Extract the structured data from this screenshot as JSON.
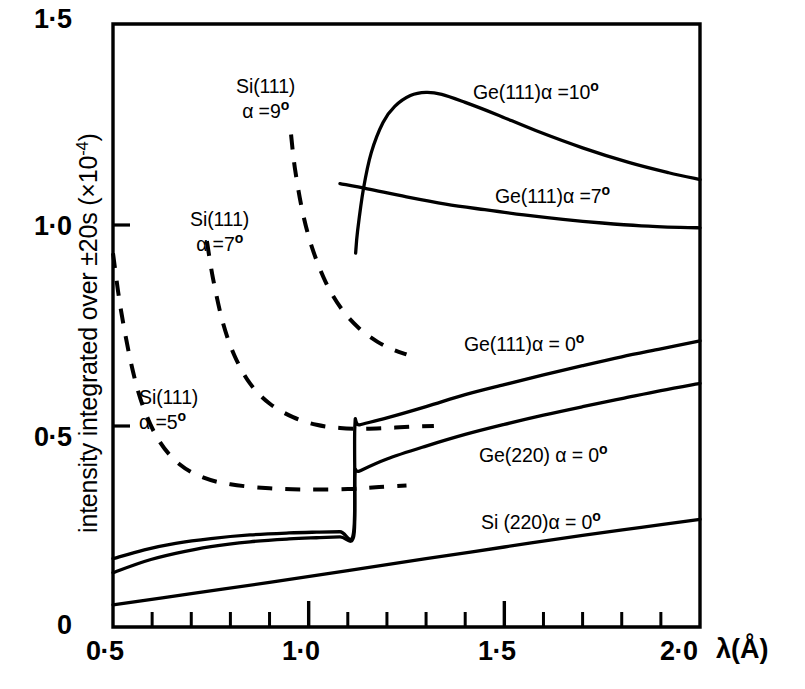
{
  "figure": {
    "background_color": "#ffffff",
    "line_color": "#000000"
  },
  "axes": {
    "y_title": "intensity integrated over ±20s (×10",
    "y_title_exp": "-4",
    "y_title_tail": ")",
    "x_title": "λ(Å)",
    "x_tick_labels": [
      "0·5",
      "1·0",
      "1·5",
      "2·0"
    ],
    "y_tick_labels": [
      "0",
      "0·5",
      "1·0",
      "1·5"
    ]
  },
  "labels": {
    "si111_a9_line1": "Si(111)",
    "si111_a9_line2_pre": "α =9",
    "si111_a9_line2_sup": "o",
    "si111_a7_line1": "Si(111)",
    "si111_a7_line2_pre": "α =7",
    "si111_a7_line2_sup": "o",
    "si111_a5_line1": "Si(111)",
    "si111_a5_line2_pre": "α =5",
    "si111_a5_line2_sup": "o",
    "ge111_a10_pre": "Ge(111)α =10",
    "ge111_a10_sup": "o",
    "ge111_a7_pre": "Ge(111)α =7",
    "ge111_a7_sup": "o",
    "ge111_a0_pre": "Ge(111)α = 0",
    "ge111_a0_sup": "o",
    "ge220_a0_pre": "Ge(220) α = 0",
    "ge220_a0_sup": "o",
    "si220_a0_pre": "Si (220)α = 0",
    "si220_a0_sup": "o"
  },
  "chart_data": {
    "type": "line",
    "title": "",
    "xlabel": "λ(Å)",
    "ylabel": "intensity integrated over ±20s (×10^-4)",
    "xlim": [
      0.5,
      2.0
    ],
    "ylim": [
      0.0,
      1.5
    ],
    "xticks": [
      0.5,
      1.0,
      1.5,
      2.0
    ],
    "yticks": [
      0.0,
      0.5,
      1.0,
      1.5
    ],
    "xminor_step": 0.1,
    "grid": false,
    "legend": "inline-annotations",
    "series": [
      {
        "name": "Ge(111)α =10°",
        "style": "solid",
        "x": [
          1.12,
          1.125,
          1.14,
          1.16,
          1.19,
          1.22,
          1.26,
          1.3,
          1.34,
          1.4,
          1.48,
          1.58,
          1.7,
          1.82,
          1.92,
          2.0
        ],
        "y": [
          0.93,
          0.985,
          1.09,
          1.18,
          1.255,
          1.295,
          1.322,
          1.33,
          1.325,
          1.305,
          1.275,
          1.235,
          1.192,
          1.155,
          1.13,
          1.113
        ]
      },
      {
        "name": "Ge(111)α =7°",
        "style": "solid",
        "x": [
          1.08,
          1.15,
          1.25,
          1.35,
          1.45,
          1.55,
          1.65,
          1.75,
          1.85,
          1.95,
          2.0
        ],
        "y": [
          1.103,
          1.09,
          1.07,
          1.052,
          1.038,
          1.025,
          1.014,
          1.005,
          0.998,
          0.994,
          0.993
        ]
      },
      {
        "name": "Ge(111)α = 0°",
        "style": "solid",
        "x": [
          0.5,
          0.58,
          0.66,
          0.75,
          0.85,
          0.95,
          1.02,
          1.08,
          1.115,
          1.118,
          1.13,
          1.2,
          1.3,
          1.4,
          1.5,
          1.6,
          1.7,
          1.8,
          1.9,
          2.0
        ],
        "y": [
          0.17,
          0.192,
          0.208,
          0.22,
          0.229,
          0.234,
          0.236,
          0.237,
          0.237,
          0.498,
          0.503,
          0.52,
          0.548,
          0.578,
          0.603,
          0.627,
          0.65,
          0.672,
          0.692,
          0.712
        ]
      },
      {
        "name": "Ge(220) α = 0°",
        "style": "solid",
        "x": [
          0.5,
          0.58,
          0.66,
          0.75,
          0.85,
          0.95,
          1.02,
          1.08,
          1.115,
          1.118,
          1.13,
          1.2,
          1.3,
          1.4,
          1.5,
          1.6,
          1.7,
          1.8,
          1.9,
          2.0
        ],
        "y": [
          0.135,
          0.163,
          0.183,
          0.2,
          0.212,
          0.219,
          0.222,
          0.224,
          0.225,
          0.38,
          0.388,
          0.418,
          0.45,
          0.479,
          0.504,
          0.527,
          0.548,
          0.568,
          0.588,
          0.606
        ]
      },
      {
        "name": "Si (220)α = 0°",
        "style": "solid",
        "x": [
          0.5,
          0.7,
          0.9,
          1.1,
          1.3,
          1.5,
          1.7,
          1.85,
          2.0
        ],
        "y": [
          0.055,
          0.083,
          0.111,
          0.14,
          0.17,
          0.199,
          0.228,
          0.248,
          0.268
        ]
      },
      {
        "name": "Si(111)α =5°",
        "style": "dashed",
        "x": [
          0.5,
          0.52,
          0.55,
          0.58,
          0.62,
          0.67,
          0.73,
          0.8,
          0.9,
          1.0,
          1.1,
          1.18,
          1.25
        ],
        "y": [
          0.93,
          0.79,
          0.64,
          0.54,
          0.46,
          0.405,
          0.372,
          0.355,
          0.345,
          0.342,
          0.343,
          0.348,
          0.352
        ]
      },
      {
        "name": "Si(111)α =7°",
        "style": "dashed",
        "x": [
          0.74,
          0.755,
          0.78,
          0.81,
          0.85,
          0.9,
          0.96,
          1.02,
          1.08,
          1.14,
          1.2,
          1.26,
          1.32
        ],
        "y": [
          0.96,
          0.87,
          0.76,
          0.676,
          0.606,
          0.556,
          0.522,
          0.503,
          0.495,
          0.493,
          0.495,
          0.498,
          0.5
        ]
      },
      {
        "name": "Si(111)α =9°",
        "style": "dashed",
        "x": [
          0.955,
          0.965,
          0.985,
          1.01,
          1.045,
          1.085,
          1.13,
          1.175,
          1.215,
          1.25
        ],
        "y": [
          1.225,
          1.14,
          1.03,
          0.94,
          0.855,
          0.79,
          0.742,
          0.71,
          0.69,
          0.678
        ]
      }
    ]
  }
}
